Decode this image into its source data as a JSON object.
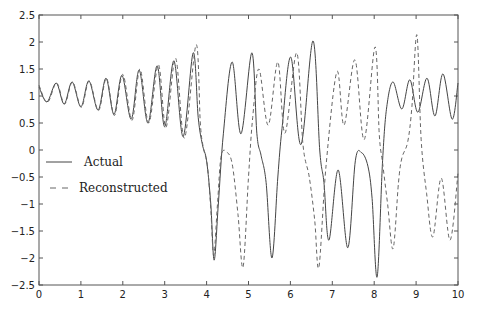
{
  "chart_data": {
    "type": "line",
    "title": "",
    "xlabel": "",
    "ylabel": "",
    "xlim": [
      0,
      10
    ],
    "ylim": [
      -2.5,
      2.5
    ],
    "grid": false,
    "legend_position": "left-middle",
    "x_ticks": [
      "0",
      "1",
      "2",
      "3",
      "4",
      "5",
      "6",
      "7",
      "8",
      "9",
      "10"
    ],
    "y_ticks": [
      "2.5",
      "2",
      "1.5",
      "1",
      "0.5",
      "0",
      "-0.5",
      "-1",
      "-1.5",
      "-2",
      "-2.5"
    ],
    "series": [
      {
        "name": "Actual",
        "style": "solid",
        "color": "#444444",
        "points": [
          [
            0.0,
            1.17
          ],
          [
            0.19,
            0.89
          ],
          [
            0.41,
            1.24
          ],
          [
            0.6,
            0.85
          ],
          [
            0.79,
            1.26
          ],
          [
            1.0,
            0.8
          ],
          [
            1.19,
            1.28
          ],
          [
            1.41,
            0.74
          ],
          [
            1.6,
            1.33
          ],
          [
            1.79,
            0.66
          ],
          [
            1.98,
            1.38
          ],
          [
            2.2,
            0.57
          ],
          [
            2.39,
            1.48
          ],
          [
            2.6,
            0.5
          ],
          [
            2.82,
            1.56
          ],
          [
            3.0,
            0.43
          ],
          [
            3.22,
            1.65
          ],
          [
            3.44,
            0.25
          ],
          [
            3.68,
            1.8
          ],
          [
            3.8,
            0.6
          ],
          [
            3.9,
            0.1
          ],
          [
            4.0,
            -0.2
          ],
          [
            4.1,
            -1.0
          ],
          [
            4.18,
            -2.04
          ],
          [
            4.28,
            -1.0
          ],
          [
            4.4,
            0.3
          ],
          [
            4.61,
            1.63
          ],
          [
            4.82,
            0.3
          ],
          [
            5.08,
            1.8
          ],
          [
            5.2,
            0.3
          ],
          [
            5.3,
            -0.1
          ],
          [
            5.42,
            -0.6
          ],
          [
            5.56,
            -2.0
          ],
          [
            5.7,
            -0.5
          ],
          [
            5.8,
            0.4
          ],
          [
            6.01,
            1.72
          ],
          [
            6.25,
            0.1
          ],
          [
            6.54,
            2.02
          ],
          [
            6.7,
            0.0
          ],
          [
            6.8,
            -0.6
          ],
          [
            6.92,
            -1.67
          ],
          [
            7.14,
            -0.37
          ],
          [
            7.37,
            -1.81
          ],
          [
            7.55,
            -0.2
          ],
          [
            7.7,
            -0.05
          ],
          [
            7.85,
            -0.3
          ],
          [
            7.95,
            -0.9
          ],
          [
            8.07,
            -2.35
          ],
          [
            8.2,
            -0.2
          ],
          [
            8.3,
            0.8
          ],
          [
            8.45,
            1.26
          ],
          [
            8.66,
            0.76
          ],
          [
            8.85,
            1.3
          ],
          [
            9.04,
            0.7
          ],
          [
            9.26,
            1.33
          ],
          [
            9.45,
            0.63
          ],
          [
            9.64,
            1.41
          ],
          [
            9.86,
            0.57
          ],
          [
            10.0,
            1.24
          ]
        ]
      },
      {
        "name": "Reconstructed",
        "style": "dashed",
        "color": "#666666",
        "points": [
          [
            0.0,
            1.2
          ],
          [
            0.2,
            0.88
          ],
          [
            0.42,
            1.24
          ],
          [
            0.61,
            0.85
          ],
          [
            0.8,
            1.26
          ],
          [
            1.01,
            0.79
          ],
          [
            1.2,
            1.28
          ],
          [
            1.42,
            0.73
          ],
          [
            1.61,
            1.33
          ],
          [
            1.8,
            0.64
          ],
          [
            2.0,
            1.4
          ],
          [
            2.22,
            0.55
          ],
          [
            2.41,
            1.5
          ],
          [
            2.62,
            0.5
          ],
          [
            2.85,
            1.58
          ],
          [
            3.03,
            0.42
          ],
          [
            3.26,
            1.7
          ],
          [
            3.47,
            0.22
          ],
          [
            3.75,
            1.95
          ],
          [
            3.85,
            0.5
          ],
          [
            3.92,
            0.05
          ],
          [
            4.02,
            -0.3
          ],
          [
            4.1,
            -1.1
          ],
          [
            4.17,
            -1.95
          ],
          [
            4.26,
            -1.0
          ],
          [
            4.35,
            -0.1
          ],
          [
            4.5,
            -0.05
          ],
          [
            4.62,
            -0.3
          ],
          [
            4.75,
            -1.2
          ],
          [
            4.87,
            -2.17
          ],
          [
            5.0,
            -0.5
          ],
          [
            5.1,
            0.6
          ],
          [
            5.25,
            1.5
          ],
          [
            5.47,
            0.46
          ],
          [
            5.7,
            1.63
          ],
          [
            5.87,
            0.31
          ],
          [
            6.15,
            1.8
          ],
          [
            6.3,
            0.1
          ],
          [
            6.45,
            -0.5
          ],
          [
            6.58,
            -1.3
          ],
          [
            6.68,
            -2.17
          ],
          [
            6.85,
            -0.3
          ],
          [
            7.11,
            1.45
          ],
          [
            7.28,
            0.46
          ],
          [
            7.54,
            1.67
          ],
          [
            7.76,
            0.19
          ],
          [
            8.02,
            1.91
          ],
          [
            8.12,
            0.3
          ],
          [
            8.2,
            -0.24
          ],
          [
            8.32,
            -1.0
          ],
          [
            8.45,
            -1.83
          ],
          [
            8.58,
            -0.6
          ],
          [
            8.66,
            -0.15
          ],
          [
            8.8,
            0.15
          ],
          [
            8.9,
            0.8
          ],
          [
            9.02,
            2.13
          ],
          [
            9.12,
            0.2
          ],
          [
            9.25,
            -0.8
          ],
          [
            9.4,
            -1.61
          ],
          [
            9.6,
            -0.52
          ],
          [
            9.81,
            -1.67
          ],
          [
            10.0,
            -0.43
          ]
        ]
      }
    ]
  },
  "legend": {
    "items": [
      {
        "label": "Actual",
        "style": "solid"
      },
      {
        "label": "Reconstructed",
        "style": "dashed"
      }
    ]
  }
}
